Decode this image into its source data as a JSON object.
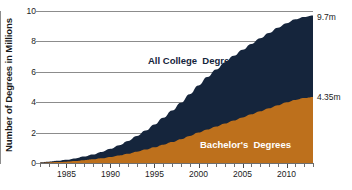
{
  "chart_data": {
    "type": "area",
    "stacked": true,
    "title": "",
    "subtitle": "",
    "xlabel": "",
    "ylabel": "Number of Degrees in Millions",
    "xlim": [
      1982,
      2013
    ],
    "ylim": [
      0,
      10
    ],
    "ytick_step": 2,
    "grid": true,
    "grid_axis": "y",
    "legend_position": "inline-annotation",
    "y_ticks": [
      "0",
      "2",
      "4",
      "6",
      "8",
      "10"
    ],
    "y_tick_values": [
      0,
      2,
      4,
      6,
      8,
      10
    ],
    "x_ticks": [
      "1985",
      "1990",
      "1995",
      "2000",
      "2005",
      "2010"
    ],
    "x_tick_values": [
      1985,
      1990,
      1995,
      2000,
      2005,
      2010
    ],
    "x_minor_tick_interval": 1,
    "x": [
      1982,
      1983,
      1984,
      1985,
      1986,
      1987,
      1988,
      1989,
      1990,
      1991,
      1992,
      1993,
      1994,
      1995,
      1996,
      1997,
      1998,
      1999,
      2000,
      2001,
      2002,
      2003,
      2004,
      2005,
      2006,
      2007,
      2008,
      2009,
      2010,
      2011,
      2012,
      2013
    ],
    "series": [
      {
        "name": "Bachelor's  Degrees",
        "color": "#bd701c",
        "label_color": "#ffffff",
        "values": [
          0.02,
          0.04,
          0.06,
          0.09,
          0.13,
          0.18,
          0.24,
          0.31,
          0.4,
          0.5,
          0.61,
          0.74,
          0.88,
          1.03,
          1.2,
          1.38,
          1.57,
          1.78,
          2.0,
          2.2,
          2.4,
          2.6,
          2.8,
          3.0,
          3.2,
          3.4,
          3.6,
          3.8,
          4.0,
          4.15,
          4.27,
          4.35
        ],
        "end_value": 4.35,
        "end_label": "4.35m"
      },
      {
        "name": "All College  Degrees",
        "color": "#15253c",
        "label_color": "#15253c",
        "values": [
          0.04,
          0.08,
          0.14,
          0.21,
          0.3,
          0.42,
          0.56,
          0.73,
          0.93,
          1.17,
          1.45,
          1.77,
          2.13,
          2.53,
          2.97,
          3.45,
          3.97,
          4.53,
          5.1,
          5.65,
          6.15,
          6.62,
          7.05,
          7.45,
          7.83,
          8.2,
          8.55,
          8.9,
          9.2,
          9.45,
          9.6,
          9.7
        ],
        "is_total": true,
        "end_value": 9.7,
        "end_label": "9.7m"
      }
    ],
    "annotations": [
      {
        "text": "All College  Degrees",
        "x": 2002,
        "y": 7.0
      },
      {
        "text": "Bachelor's  Degrees",
        "x": 2008,
        "y": 1.5
      },
      {
        "text": "9.7m",
        "x": 2013,
        "y": 9.7
      },
      {
        "text": "4.35m",
        "x": 2013,
        "y": 4.35
      }
    ],
    "colors": {
      "series_total": "#15253c",
      "series_bachelors": "#bd701c",
      "gridline": "#8c8c8c",
      "axis": "#6e6e6e",
      "background": "#ffffff",
      "text": "#1b1b1b"
    }
  }
}
